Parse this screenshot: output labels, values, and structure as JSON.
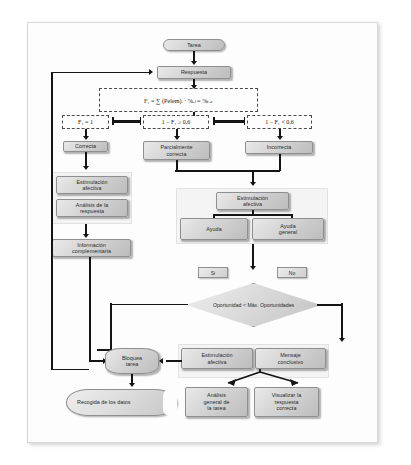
{
  "diagram": {
    "language": "es",
    "nodes": {
      "tarea": "Tarea",
      "respuesta": "Respuesta",
      "correcta": "Correcta",
      "parcialmente_correcta_l1": "Parcialmente",
      "parcialmente_correcta_l2": "correcta",
      "incorrecta": "Incorrecta",
      "estimulacion_afectiva_izq_l1": "Estimulación",
      "estimulacion_afectiva_izq_l2": "afectiva",
      "analisis_respuesta_l1": "Análisis de la",
      "analisis_respuesta_l2": "respuesta",
      "informacion_complementaria_l1": "Información",
      "informacion_complementaria_l2": "complementaria",
      "estimulacion_afectiva_der_l1": "Estimulación",
      "estimulacion_afectiva_der_l2": "afectiva",
      "ayuda": "Ayuda",
      "ayuda_general_l1": "Ayuda",
      "ayuda_general_l2": "general",
      "decision_l1": "Oportunidad <",
      "decision_l2": "Máx.",
      "decision_l3": "Oportunidades",
      "si": "Si",
      "no": "No",
      "bloquea_tarea_l1": "Bloquea",
      "bloquea_tarea_l2": "tarea",
      "estimulacion_afectiva_inf_l1": "Estimulación",
      "estimulacion_afectiva_inf_l2": "afectiva",
      "mensaje_conclusivo_l1": "Mensaje",
      "mensaje_conclusivo_l2": "conclusivo",
      "recogida_datos_l1": "Recogida de",
      "recogida_datos_l2": "los datos",
      "analisis_general_l1": "Análisis",
      "analisis_general_l2": "general de",
      "analisis_general_l3": "la tarea",
      "visualizar_l1": "Visualizar la",
      "visualizar_l2": "respuesta",
      "visualizar_l3": "correcta"
    },
    "expressions": {
      "formula": "F₁ = ∑ (Pelem)ᵢ · %ₑₗ = %ₜₒₜ",
      "cond_correcta": "F₁ = 1",
      "cond_parcial": "1 − F₁ ≥ 0,6",
      "cond_incorrecta": "1 − F₁ < 0,6"
    },
    "colors": {
      "node_fill_light": "#e9e9e9",
      "node_fill_dark": "#bdbdbd",
      "node_border": "#8f8f8f",
      "connector": "#141414",
      "group_panel": "#f4f4f4",
      "page_background": "#fdfdfd"
    }
  }
}
